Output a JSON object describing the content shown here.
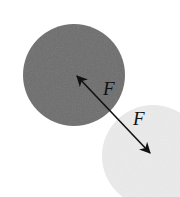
{
  "diagram": {
    "colors": {
      "background": "#ffffff",
      "dark_sphere": "#6d6d6d",
      "light_sphere": "#ebebeb",
      "arrow": "#111111"
    },
    "sphere_dark": {
      "cx": 74,
      "cy": 75,
      "r": 51
    },
    "sphere_light": {
      "cx": 153,
      "cy": 156,
      "r": 51
    },
    "force_arrow": {
      "x1": 75,
      "y1": 74,
      "x2": 152,
      "y2": 155
    },
    "labels": {
      "force_on_dark": "F",
      "force_on_light": "F"
    }
  }
}
